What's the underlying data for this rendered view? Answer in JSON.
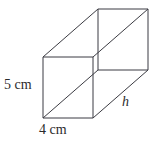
{
  "figure": {
    "kind": "cuboid-oblique-projection",
    "stroke_color": "#3b3b42",
    "background_color": "#ffffff",
    "labels": {
      "height": "5 cm",
      "width": "4 cm",
      "depth": "h"
    },
    "geometry": {
      "front_face": [
        [
          43,
          57
        ],
        [
          93,
          57
        ],
        [
          93,
          118
        ],
        [
          43,
          118
        ]
      ],
      "back_face": [
        [
          98,
          9
        ],
        [
          148,
          9
        ],
        [
          148,
          70
        ],
        [
          98,
          70
        ]
      ],
      "depth_offset": [
        55,
        -48
      ]
    }
  }
}
